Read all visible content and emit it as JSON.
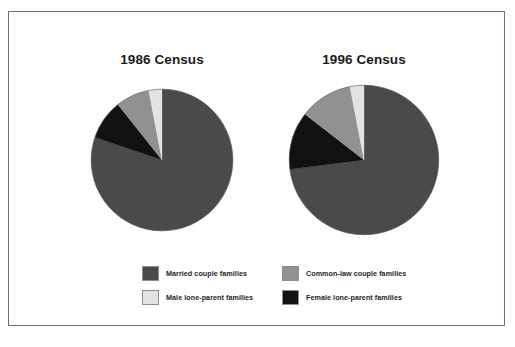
{
  "figure": {
    "background_color": "#ffffff",
    "border_color": "#6e6e72"
  },
  "charts": [
    {
      "id": "1986",
      "title": "1986 Census"
    },
    {
      "id": "1996",
      "title": "1996 Census"
    }
  ],
  "legend": {
    "items": [
      {
        "label": "Married couple families",
        "color": "#4a4a4a"
      },
      {
        "label": "Common-law couple families",
        "color": "#919191"
      },
      {
        "label": "Male lone-parent families",
        "color": "#e3e3e3"
      },
      {
        "label": "Female lone-parent families",
        "color": "#111111"
      }
    ]
  },
  "chart_data": [
    {
      "type": "pie",
      "title": "1986 Census",
      "labels": [
        "Married couple families",
        "Female lone-parent families",
        "Common-law couple families",
        "Male lone-parent families"
      ],
      "values": [
        80.2,
        9.1,
        7.7,
        3.0
      ],
      "colors": [
        "#4a4a4a",
        "#111111",
        "#919191",
        "#e3e3e3"
      ],
      "start_angle_deg": 0,
      "direction": "clockwise",
      "legend_position": "bottom",
      "grid": false
    },
    {
      "type": "pie",
      "title": "1996 Census",
      "labels": [
        "Married couple families",
        "Female lone-parent families",
        "Common-law couple families",
        "Male lone-parent families"
      ],
      "values": [
        73.0,
        12.5,
        11.5,
        3.0
      ],
      "colors": [
        "#4a4a4a",
        "#111111",
        "#919191",
        "#e3e3e3"
      ],
      "start_angle_deg": 0,
      "direction": "clockwise",
      "legend_position": "bottom",
      "grid": false
    }
  ]
}
